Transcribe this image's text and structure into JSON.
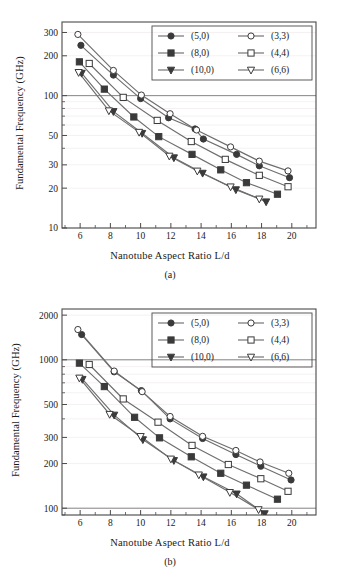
{
  "figure": {
    "panels": [
      {
        "caption": "(a)",
        "xlabel": "Nanotube Aspect Ratio  L/d",
        "ylabel": "Fundamental Frequency (GHz)"
      },
      {
        "caption": "(b)",
        "xlabel": "Nanotube Aspect Ratio  L/d",
        "ylabel": "Fundamental Frequency (GHz)"
      }
    ]
  },
  "chart_data": [
    {
      "type": "line",
      "panel": "(a)",
      "title": "",
      "xlabel": "Nanotube Aspect Ratio  L/d",
      "ylabel": "Fundamental Frequency (GHz)",
      "xscale": "linear",
      "yscale": "log",
      "xlim": [
        4.8,
        21.6
      ],
      "ylim": [
        10,
        360
      ],
      "xticks": [
        6,
        8,
        10,
        12,
        14,
        16,
        18,
        20
      ],
      "xticklabels": [
        "6",
        "8",
        "10",
        "12",
        "14",
        "16",
        "18",
        "20"
      ],
      "yticks": [
        10,
        20,
        30,
        50,
        100,
        200,
        300
      ],
      "yticklabels": [
        "10",
        "20",
        "30",
        "50",
        "100",
        "200",
        "300"
      ],
      "grid": "horizontal-minor-light",
      "reference_lines": [
        {
          "y": 100,
          "orientation": "horizontal"
        }
      ],
      "legend_position": "top-right-inside",
      "series": [
        {
          "name": "(5,0)",
          "marker": "filled-circle",
          "x": [
            6.05,
            8.2,
            10.0,
            11.85,
            13.6,
            14.15,
            16.35,
            17.85,
            19.85
          ],
          "y": [
            240,
            143,
            95,
            68,
            56,
            47,
            36,
            29.5,
            24
          ]
        },
        {
          "name": "(8,0)",
          "marker": "filled-square",
          "x": [
            5.95,
            7.6,
            9.55,
            11.2,
            13.4,
            15.3,
            17.0,
            19.05
          ],
          "y": [
            180,
            112,
            69,
            49,
            36,
            27.5,
            22,
            18
          ]
        },
        {
          "name": "(10,0)",
          "marker": "filled-triangle-down",
          "x": [
            6.1,
            8.2,
            10.1,
            12.2,
            14.1,
            16.3,
            18.3
          ],
          "y": [
            148,
            76,
            52,
            34,
            26,
            19.5,
            15.8
          ]
        },
        {
          "name": "(3,3)",
          "marker": "open-circle",
          "x": [
            5.85,
            8.2,
            10.05,
            11.95,
            13.7,
            15.95,
            17.85,
            19.75
          ],
          "y": [
            290,
            155,
            101,
            73,
            55,
            41,
            32,
            27
          ]
        },
        {
          "name": "(4,4)",
          "marker": "open-square",
          "x": [
            6.6,
            8.85,
            11.1,
            13.35,
            15.6,
            17.85,
            19.75
          ],
          "y": [
            175,
            97,
            65,
            45,
            33,
            25,
            20.5
          ]
        },
        {
          "name": "(6,6)",
          "marker": "open-triangle-down",
          "x": [
            5.9,
            7.9,
            9.9,
            11.9,
            13.75,
            15.95,
            17.85
          ],
          "y": [
            150,
            77,
            53,
            35,
            27,
            20.5,
            16.6
          ]
        }
      ]
    },
    {
      "type": "line",
      "panel": "(b)",
      "title": "",
      "xlabel": "Nanotube Aspect Ratio  L/d",
      "ylabel": "Fundamental Frequency (GHz)",
      "xscale": "linear",
      "yscale": "log",
      "xlim": [
        4.8,
        21.6
      ],
      "ylim": [
        90,
        2200
      ],
      "xticks": [
        6,
        8,
        10,
        12,
        14,
        16,
        18,
        20
      ],
      "xticklabels": [
        "6",
        "8",
        "10",
        "12",
        "14",
        "16",
        "18",
        "20"
      ],
      "yticks": [
        100,
        200,
        300,
        500,
        1000,
        2000
      ],
      "yticklabels": [
        "100",
        "200",
        "300",
        "500",
        "1000",
        "2000"
      ],
      "grid": "horizontal-minor-light",
      "reference_lines": [
        {
          "y": 1000,
          "orientation": "horizontal"
        },
        {
          "y": 100,
          "orientation": "horizontal"
        }
      ],
      "legend_position": "top-right-inside",
      "series": [
        {
          "name": "(5,0)",
          "marker": "filled-circle",
          "x": [
            6.1,
            8.25,
            10.05,
            11.95,
            14.1,
            16.3,
            17.95,
            19.95
          ],
          "y": [
            1480,
            830,
            620,
            400,
            295,
            230,
            192,
            155
          ]
        },
        {
          "name": "(8,0)",
          "marker": "filled-square",
          "x": [
            5.95,
            7.6,
            9.6,
            11.25,
            13.35,
            15.3,
            17.0,
            19.05
          ],
          "y": [
            950,
            660,
            410,
            298,
            222,
            172,
            143,
            115
          ]
        },
        {
          "name": "(10,0)",
          "marker": "filled-triangle-down",
          "x": [
            6.15,
            8.25,
            10.15,
            12.2,
            14.15,
            16.35,
            18.2
          ],
          "y": [
            740,
            425,
            290,
            210,
            163,
            125,
            92
          ]
        },
        {
          "name": "(3,3)",
          "marker": "open-circle",
          "x": [
            5.85,
            8.25,
            10.1,
            11.95,
            14.1,
            16.3,
            17.9,
            19.8
          ],
          "y": [
            1600,
            840,
            610,
            415,
            305,
            245,
            205,
            172
          ]
        },
        {
          "name": "(4,4)",
          "marker": "open-square",
          "x": [
            6.6,
            8.85,
            11.15,
            13.4,
            15.8,
            17.95,
            19.75
          ],
          "y": [
            930,
            545,
            380,
            265,
            197,
            158,
            130
          ]
        },
        {
          "name": "(6,6)",
          "marker": "open-triangle-down",
          "x": [
            5.95,
            7.95,
            10.0,
            12.0,
            13.85,
            15.9,
            17.8
          ],
          "y": [
            755,
            430,
            305,
            215,
            168,
            128,
            98
          ]
        }
      ]
    }
  ]
}
